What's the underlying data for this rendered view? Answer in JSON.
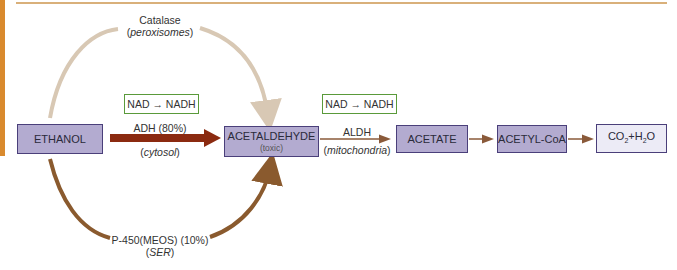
{
  "diagram": {
    "nodes": {
      "ethanol": "ETHANOL",
      "acetaldehyde": "ACETALDEHYDE",
      "acetaldehyde_note": "(toxic)",
      "acetate": "ACETATE",
      "acetyl_coa": "ACETYL-CoA",
      "co2_h2o": {
        "co": "CO",
        "sub1": "2",
        "plus_h": "+H",
        "sub2": "2",
        "o": "O"
      }
    },
    "cofactors": {
      "first": "NAD → NADH",
      "second": "NAD → NADH"
    },
    "pathways": {
      "catalase": {
        "enzyme": "Catalase",
        "location": "peroxisomes"
      },
      "adh": {
        "enzyme": "ADH (80%)",
        "location": "cytosol"
      },
      "p450": {
        "enzyme": "P-450(MEOS) (10%)",
        "location": "SER"
      },
      "aldh": {
        "enzyme": "ALDH",
        "location": "mitochondria"
      }
    },
    "colors": {
      "sidebar": "#d98a2e",
      "node_fill": "#b3abd0",
      "node_border": "#4a3f7a",
      "cofactor_border": "#5a9a3a",
      "adh_arrow": "#8b2a10",
      "catalase_arrow": "#d8c8b4",
      "p450_arrow": "#8a5a2e",
      "flow_arrow": "#8a5a3a"
    }
  }
}
